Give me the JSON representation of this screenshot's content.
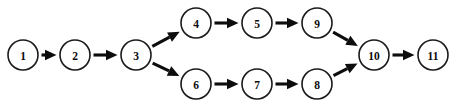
{
  "diagram": {
    "type": "directed-acyclic-graph",
    "title": "",
    "background_color": "#ffffff",
    "node_fill_color": "#ffffff",
    "node_stroke_color": "#1a1a1a",
    "edge_color": "#0d0d0d",
    "label_color": "#0d0d0d",
    "node_radius": 15,
    "nodes": [
      {
        "id": "1",
        "label": "1",
        "x": 23,
        "y": 55
      },
      {
        "id": "2",
        "label": "2",
        "x": 75,
        "y": 55
      },
      {
        "id": "3",
        "label": "3",
        "x": 136,
        "y": 55
      },
      {
        "id": "4",
        "label": "4",
        "x": 196,
        "y": 23
      },
      {
        "id": "5",
        "label": "5",
        "x": 257,
        "y": 23
      },
      {
        "id": "9",
        "label": "9",
        "x": 317,
        "y": 23
      },
      {
        "id": "6",
        "label": "6",
        "x": 196,
        "y": 84
      },
      {
        "id": "7",
        "label": "7",
        "x": 257,
        "y": 84
      },
      {
        "id": "8",
        "label": "8",
        "x": 317,
        "y": 84
      },
      {
        "id": "10",
        "label": "10",
        "x": 374,
        "y": 55
      },
      {
        "id": "11",
        "label": "11",
        "x": 433,
        "y": 55
      }
    ],
    "edges": [
      {
        "from": "1",
        "to": "2"
      },
      {
        "from": "2",
        "to": "3"
      },
      {
        "from": "3",
        "to": "4"
      },
      {
        "from": "3",
        "to": "6"
      },
      {
        "from": "4",
        "to": "5"
      },
      {
        "from": "5",
        "to": "9"
      },
      {
        "from": "9",
        "to": "10"
      },
      {
        "from": "6",
        "to": "7"
      },
      {
        "from": "7",
        "to": "8"
      },
      {
        "from": "8",
        "to": "10"
      },
      {
        "from": "10",
        "to": "11"
      }
    ]
  }
}
